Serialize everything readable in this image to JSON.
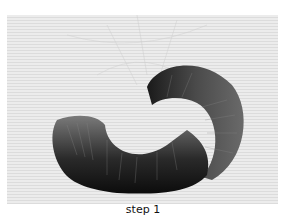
{
  "figure": {
    "image_description": "Embroidered crescent / C-shaped curl worked in long-and-short satin stitch, shading from dark near-black at the outer edges to grey toward the inner edge, on a finely woven light grey fabric with faint pencil guide lines",
    "caption": "step 1"
  }
}
